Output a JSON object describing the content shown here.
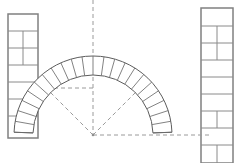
{
  "figure": {
    "title": "Semicircular masonry arch with voussoirs and construction geometry",
    "caption": "",
    "background_color": "#ffffff",
    "line_color": "#6e6e6e",
    "construction_line_color": "#9a9a9a",
    "width": 237,
    "height": 163
  },
  "geometry": {
    "center_x": 93,
    "center_y": 135,
    "intrados_radius": 60,
    "extrados_radius": 79,
    "springing_y": 88,
    "crown_y": 10,
    "arch_start_angle_deg": 178,
    "arch_end_angle_deg": 2,
    "voussoir_count": 22
  },
  "construction": {
    "vertical_axis": {
      "label": "vertical centre axis",
      "x": 93,
      "y_top": 0,
      "y_bottom": 135
    },
    "horizontal_base": {
      "label": "horizontal springing line",
      "y": 135,
      "x_left": 93,
      "x_right": 212
    },
    "left_horizontal": {
      "label": "left horizontal radius line",
      "y": 88,
      "x_left": 33,
      "x_right": 93
    },
    "radii": [
      {
        "label": "upper-left radius at 135 degrees",
        "angle_deg": 135
      },
      {
        "label": "lower-right radius at 45 degrees",
        "angle_deg": 45
      }
    ]
  },
  "left_pier": {
    "label": "left pier",
    "x": 8,
    "y": 14,
    "width": 30,
    "height": 124,
    "course_rows": 7,
    "course_lines_y": [
      31,
      48,
      65,
      82,
      99,
      116
    ],
    "header_joints_y": [
      40,
      57,
      108
    ],
    "header_joint_x": 23
  },
  "right_pier": {
    "label": "right pier",
    "x": 201,
    "y": 8,
    "width": 32,
    "height": 155,
    "course_rows": 9,
    "course_lines_y": [
      26,
      43,
      60,
      77,
      94,
      111,
      128,
      145
    ],
    "header_joints_y": [
      34,
      51,
      120,
      154
    ],
    "header_joint_x": 217
  },
  "elements": {
    "arch_band_name": "arch-voussoir-band",
    "intrados_name": "arch-intrados-curve",
    "extrados_name": "arch-extrados-curve",
    "center_point_name": "arch-centre-point"
  }
}
